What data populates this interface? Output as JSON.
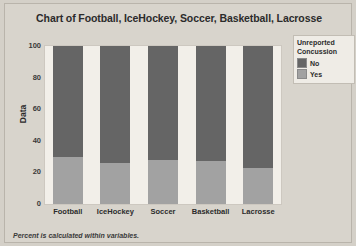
{
  "chart_data": {
    "type": "bar",
    "title": "Chart of Football, IceHockey, Soccer, Basketball, Lacrosse",
    "xlabel": "",
    "ylabel": "Data",
    "ylim": [
      0,
      100
    ],
    "ytick_labels": [
      "100",
      "80",
      "60",
      "40",
      "20",
      "0"
    ],
    "yticks": [
      100,
      80,
      60,
      40,
      20,
      0
    ],
    "grid": false,
    "stacked": true,
    "categories": [
      "Football",
      "IceHockey",
      "Soccer",
      "Basketball",
      "Lacrosse"
    ],
    "series": [
      {
        "name": "No",
        "values": [
          70,
          74,
          72,
          73,
          77
        ],
        "color": "#656565"
      },
      {
        "name": "Yes",
        "values": [
          30,
          26,
          28,
          27,
          23
        ],
        "color": "#a2a2a2"
      }
    ],
    "legend": {
      "title_line1": "Unreported",
      "title_line2": "Concussion",
      "position": "right",
      "entries": [
        {
          "label": "No",
          "color": "#656565"
        },
        {
          "label": "Yes",
          "color": "#a2a2a2"
        }
      ]
    },
    "footnote": "Percent is calculated within variables."
  },
  "colors": {
    "background": "#d4d0c8",
    "panel": "#d8d4cc",
    "plot_background": "#f2efe9",
    "series_no": "#656565",
    "series_yes": "#a2a2a2",
    "text": "#2b2b2b"
  }
}
